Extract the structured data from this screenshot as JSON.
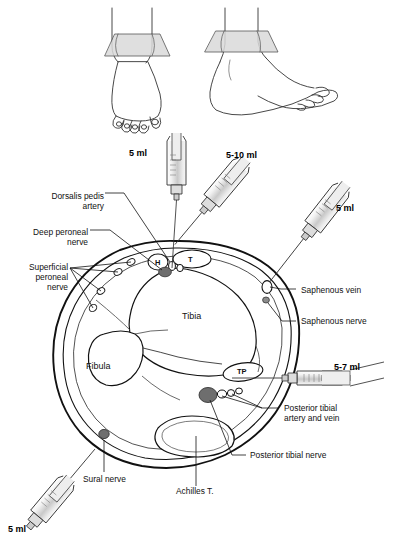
{
  "figure": {
    "background": "#ffffff"
  },
  "colors": {
    "outline": "#1a1a1a",
    "nerve_fill": "#6e6e6e",
    "plane_fill": "#d9d9d9",
    "syringe_fill": "#cfcfcf",
    "text": "#111111"
  },
  "top_illustrations": [
    {
      "name": "anterior-foot-view",
      "plane_label": "cross-section-plane"
    },
    {
      "name": "lateral-foot-view",
      "plane_label": "cross-section-plane"
    }
  ],
  "volumes": [
    {
      "id": "deep-peroneal-volume",
      "text": "5 ml",
      "x": 129,
      "y": 148
    },
    {
      "id": "superficial-peroneal-volume",
      "text": "5-10 ml",
      "x": 226,
      "y": 150
    },
    {
      "id": "saphenous-volume",
      "text": "5 ml",
      "x": 336,
      "y": 203
    },
    {
      "id": "posterior-tibial-volume",
      "text": "5-7 ml",
      "x": 334,
      "y": 362
    },
    {
      "id": "sural-volume",
      "text": "5 ml",
      "x": 8,
      "y": 524
    }
  ],
  "labels": [
    {
      "id": "dorsalis-pedis-artery",
      "text": "Dorsalis pedis\nartery",
      "x": 55,
      "y": 191,
      "align": "right"
    },
    {
      "id": "deep-peroneal-nerve",
      "text": "Deep peroneal\nnerve",
      "x": 18,
      "y": 227,
      "align": "right"
    },
    {
      "id": "superficial-peroneal-nerve",
      "text": "Superficial\nperoneal\nnerve",
      "x": 3,
      "y": 262,
      "align": "right"
    },
    {
      "id": "saphenous-vein",
      "text": "Saphenous vein",
      "x": 300,
      "y": 290,
      "align": "left"
    },
    {
      "id": "saphenous-nerve",
      "text": "Saphenous nerve",
      "x": 300,
      "y": 319,
      "align": "left"
    },
    {
      "id": "posterior-tibial-artery-vein",
      "text": "Posterior tibial\nartery and vein",
      "x": 283,
      "y": 404,
      "align": "left"
    },
    {
      "id": "posterior-tibial-nerve",
      "text": "Posterior tibial nerve",
      "x": 249,
      "y": 452,
      "align": "left"
    },
    {
      "id": "sural-nerve",
      "text": "Sural nerve",
      "x": 82,
      "y": 477,
      "align": "left"
    },
    {
      "id": "achilles-tendon",
      "text": "Achilles T.",
      "x": 175,
      "y": 489,
      "align": "left"
    }
  ],
  "structures": [
    {
      "id": "tibia-label",
      "text": "Tibia",
      "x": 182,
      "y": 311
    },
    {
      "id": "fibula-label",
      "text": "Fibula",
      "x": 85,
      "y": 361
    }
  ],
  "markers": [
    {
      "id": "tendon-marker-h",
      "text": "H",
      "x": 155,
      "y": 259
    },
    {
      "id": "tendon-marker-t",
      "text": "T",
      "x": 186,
      "y": 256
    },
    {
      "id": "tendon-marker-tp",
      "text": "TP",
      "x": 241,
      "y": 370
    }
  ]
}
